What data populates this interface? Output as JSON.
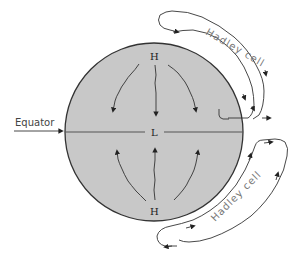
{
  "diagram": {
    "title": "",
    "labels": {
      "equator": "Equator",
      "north_high": "H",
      "south_high": "H",
      "equatorial_low": "L",
      "north_cell": "Hadley cell",
      "south_cell": "Hadley cell"
    },
    "colors": {
      "globe_fill": "#c8c8c8",
      "outline": "#333333",
      "text": "#222222",
      "cell_text": "#777777"
    },
    "nodes": [
      {
        "id": "H-north",
        "label": "H",
        "type": "high-pressure"
      },
      {
        "id": "L-equator",
        "label": "L",
        "type": "low-pressure"
      },
      {
        "id": "H-south",
        "label": "H",
        "type": "high-pressure"
      },
      {
        "id": "cell-north",
        "label": "Hadley cell",
        "type": "circulation-loop"
      },
      {
        "id": "cell-south",
        "label": "Hadley cell",
        "type": "circulation-loop"
      }
    ],
    "edges": [
      {
        "from": "H-north",
        "to": "L-equator",
        "label": "surface wind (left)"
      },
      {
        "from": "H-north",
        "to": "L-equator",
        "label": "surface wind (center)"
      },
      {
        "from": "H-north",
        "to": "L-equator",
        "label": "surface wind (right)"
      },
      {
        "from": "H-south",
        "to": "L-equator",
        "label": "surface wind (left)"
      },
      {
        "from": "H-south",
        "to": "L-equator",
        "label": "surface wind (center)"
      },
      {
        "from": "H-south",
        "to": "L-equator",
        "label": "surface wind (right)"
      }
    ]
  }
}
